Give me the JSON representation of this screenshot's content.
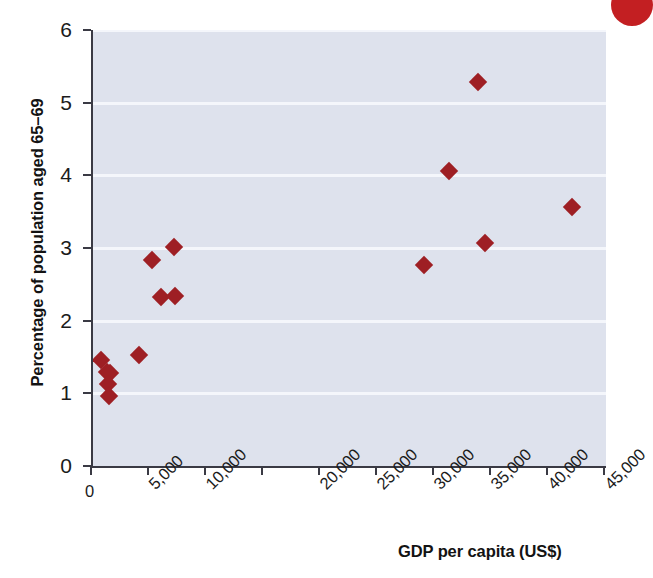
{
  "figure": {
    "background_color": "#ffffff",
    "plot_background_color": "#dee2ed",
    "gridline_color": "#f4f6fb",
    "axis_color": "#3a3a44",
    "marker_color": "#9e1f24",
    "badge_color": "#c31f22",
    "badge_name": "corner-badge"
  },
  "chart_data": {
    "type": "scatter",
    "title": "",
    "subtitle": "",
    "xlabel": "GDP per capita (US$)",
    "ylabel": "Percentage of population aged 65–69",
    "xlim": [
      0,
      45000
    ],
    "ylim": [
      0,
      6
    ],
    "grid": true,
    "legend": null,
    "xticks": [
      0,
      5000,
      10000,
      15000,
      20000,
      25000,
      30000,
      35000,
      40000,
      45000
    ],
    "xtick_labels": [
      "0",
      "5,000",
      "10,000",
      "",
      "20,000",
      "25,000",
      "30,000",
      "35,000",
      "40,000",
      "45,000"
    ],
    "yticks": [
      0,
      1,
      2,
      3,
      4,
      5,
      6
    ],
    "ytick_labels": [
      "0",
      "1",
      "2",
      "3",
      "4",
      "5",
      "6"
    ],
    "marker_shape": "diamond",
    "series": [
      {
        "name": "countries",
        "color": "#9e1f24",
        "points": [
          {
            "x": 700,
            "y": 1.46
          },
          {
            "x": 1200,
            "y": 1.3
          },
          {
            "x": 1500,
            "y": 1.28
          },
          {
            "x": 1300,
            "y": 1.13
          },
          {
            "x": 1400,
            "y": 0.97
          },
          {
            "x": 4000,
            "y": 1.53
          },
          {
            "x": 5200,
            "y": 2.84
          },
          {
            "x": 6000,
            "y": 2.33
          },
          {
            "x": 7100,
            "y": 3.02
          },
          {
            "x": 7200,
            "y": 2.34
          },
          {
            "x": 29000,
            "y": 2.77
          },
          {
            "x": 31200,
            "y": 4.06
          },
          {
            "x": 33800,
            "y": 5.29
          },
          {
            "x": 34400,
            "y": 3.07
          },
          {
            "x": 42000,
            "y": 3.56
          }
        ]
      }
    ]
  }
}
